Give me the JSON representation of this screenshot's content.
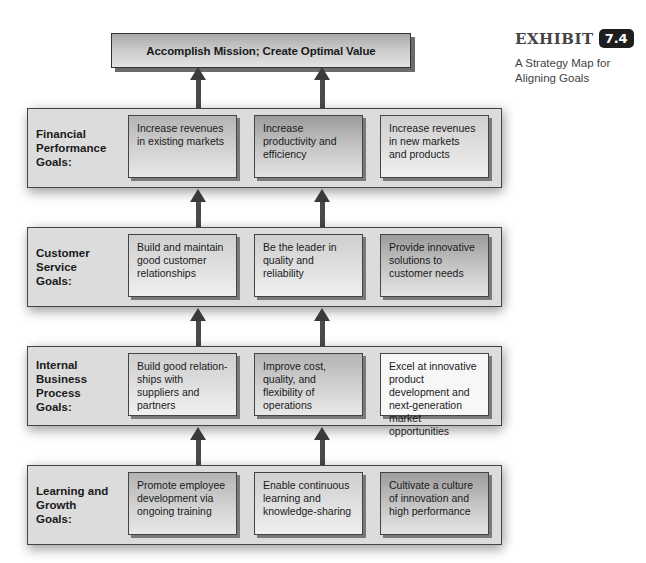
{
  "exhibit": {
    "word": "EXHIBIT",
    "number": "7.4",
    "caption": "A Strategy Map for Aligning Goals"
  },
  "mission": {
    "label": "Accomplish Mission; Create Optimal Value"
  },
  "sections": [
    {
      "label_lines": [
        "Financial",
        "Performance",
        "Goals:"
      ],
      "goals": [
        "Increase revenues in existing markets",
        "Increase productivity and efficiency",
        "Increase revenues in new markets and products"
      ]
    },
    {
      "label_lines": [
        "Customer",
        "Service",
        "Goals:"
      ],
      "goals": [
        "Build and maintain good customer relationships",
        "Be the leader in quality and reliability",
        "Provide innovative solutions to customer needs"
      ]
    },
    {
      "label_lines": [
        "Internal",
        "Business",
        "Process",
        "Goals:"
      ],
      "goals": [
        "Build good relation-ships with suppliers and partners",
        "Improve cost, quality, and flexibility of operations",
        "Excel at innovative product development and next-generation market opportunities"
      ]
    },
    {
      "label_lines": [
        "Learning and",
        "Growth",
        "Goals:"
      ],
      "goals": [
        "Promote employee development via ongoing training",
        "Enable continuous learning and knowledge-sharing",
        "Cultivate a culture of innovation and high performance"
      ]
    }
  ],
  "colors": {
    "arrow": "#3a3a3a",
    "section_bg": "#dcdcdc",
    "exhibit_badge": "#1e1e1e"
  }
}
